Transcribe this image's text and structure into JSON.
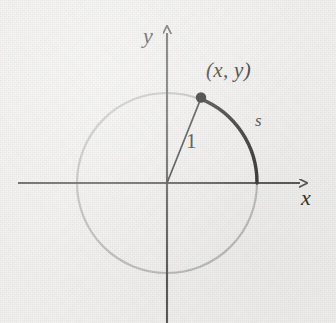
{
  "figure": {
    "kind": "unit-circle-arc-length-diagram",
    "width": 336,
    "height": 323,
    "background_color": "#f3f2f0"
  },
  "axes": {
    "x": {
      "label": "x",
      "color": "#555555",
      "y_position": 183,
      "start_x": 18,
      "end_x": 303,
      "arrow": "right"
    },
    "y": {
      "label": "y",
      "color": "#555555",
      "x_position": 167,
      "start_y": 30,
      "end_y": 323,
      "arrow": "up"
    },
    "origin": {
      "x": 167,
      "y": 183
    }
  },
  "circle": {
    "center_x": 167,
    "center_y": 183,
    "radius": 90,
    "stroke_color": "#bcbcbc",
    "stroke_width": 2.2
  },
  "arc": {
    "label": "s",
    "stroke_color": "#2f2f2f",
    "stroke_width": 3.4,
    "start_angle_deg": 0,
    "end_angle_deg": 68,
    "description": "arc of length s from the positive x-axis to the point (x, y)"
  },
  "radius_segment": {
    "label": "1",
    "stroke_color": "#3a3a3a",
    "stroke_width": 1.6,
    "from": {
      "x": 167,
      "y": 183
    },
    "to": {
      "x": 201,
      "y": 99
    }
  },
  "point": {
    "label": "(x, y)",
    "x": 201,
    "y": 99,
    "dot_radius": 5,
    "dot_color": "#1c1c1c"
  },
  "labels": {
    "y_axis": "y",
    "x_axis": "x",
    "point": "(x, y)",
    "arc": "s",
    "radius": "1"
  }
}
